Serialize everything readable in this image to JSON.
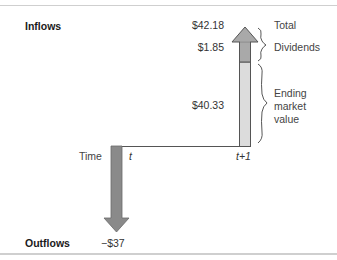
{
  "labels": {
    "inflows": "Inflows",
    "outflows": "Outflows",
    "time": "Time",
    "t": "t",
    "t_plus_1": "t+1"
  },
  "values": {
    "total": "$42.18",
    "dividends": "$1.85",
    "ending_market_value": "$40.33",
    "outflow": "−$37"
  },
  "annotations": {
    "total": "Total",
    "dividends": "Dividends",
    "ending_line1": "Ending",
    "ending_line2": "market",
    "ending_line3": "value"
  },
  "colors": {
    "outflow_arrow": "#8a8a8a",
    "dividend_segment": "#a9a9a9",
    "market_value_segment": "#dcdcdc",
    "outline": "#555555"
  }
}
